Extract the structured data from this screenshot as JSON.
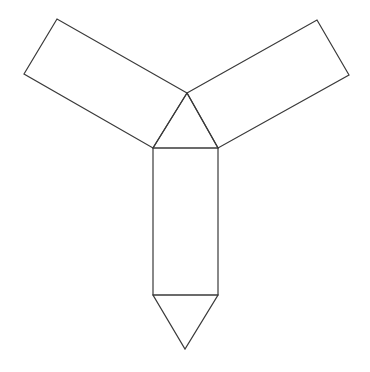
{
  "diagram": {
    "type": "geometric-net",
    "stroke_color": "#3a3a3a",
    "background": "#ffffff",
    "shapes": [
      {
        "name": "central-triangle",
        "points": [
          [
            187,
            93
          ],
          [
            153,
            148
          ],
          [
            218,
            148
          ]
        ]
      },
      {
        "name": "bottom-rectangle",
        "points": [
          [
            153,
            148
          ],
          [
            218,
            148
          ],
          [
            218,
            295
          ],
          [
            153,
            295
          ]
        ]
      },
      {
        "name": "bottom-triangle",
        "points": [
          [
            153,
            295
          ],
          [
            218,
            295
          ],
          [
            185,
            349
          ]
        ]
      },
      {
        "name": "left-rectangle",
        "points": [
          [
            187,
            93
          ],
          [
            57,
            19
          ],
          [
            24,
            74
          ],
          [
            153,
            148
          ]
        ]
      },
      {
        "name": "right-rectangle",
        "points": [
          [
            187,
            93
          ],
          [
            317,
            20
          ],
          [
            349,
            75
          ],
          [
            218,
            148
          ]
        ]
      }
    ]
  }
}
